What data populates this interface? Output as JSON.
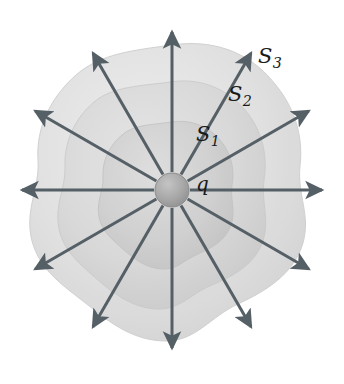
{
  "figure": {
    "name": "electric-field-point-charge-nested-gaussian-surfaces",
    "background_color": "#ffffff",
    "width": 344,
    "height": 384
  },
  "labels": {
    "s1": {
      "base": "S",
      "sub": "1"
    },
    "s2": {
      "base": "S",
      "sub": "2"
    },
    "s3": {
      "base": "S",
      "sub": "3"
    },
    "charge": "q"
  },
  "charge": {
    "name": "point-charge-sphere",
    "center_x": 172,
    "center_y": 190,
    "radius": 17,
    "fill_color": "#a9a9a9",
    "edge_color": "#8a8a8a"
  },
  "field_lines": {
    "name": "electric-field-lines",
    "count": 12,
    "angle_step_deg": 30,
    "color": "#555f66",
    "stroke_width": 3,
    "inner_radius": 18,
    "arrow_tip_radius": 158
  },
  "surfaces": [
    {
      "id": "S1",
      "label": "S1",
      "fill_color": "#d2d2d2",
      "opacity": 0.75,
      "radius": 62
    },
    {
      "id": "S2",
      "label": "S2",
      "fill_color": "#d8d8d8",
      "opacity": 0.62,
      "radius": 103
    },
    {
      "id": "S3",
      "label": "S3",
      "fill_color": "#dedede",
      "opacity": 0.55,
      "radius": 145
    }
  ],
  "colors": {
    "arrow": "#555f66",
    "label_text": "#1a1a1a",
    "surface_light": "#dedede",
    "surface_mid": "#d8d8d8",
    "surface_dark": "#d2d2d2"
  }
}
